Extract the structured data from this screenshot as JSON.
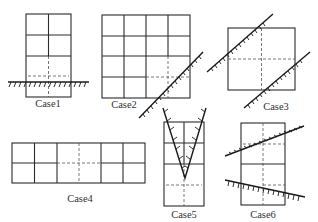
{
  "figure": {
    "cases": [
      {
        "id": "case1",
        "label": "Case1",
        "label_pos": [
          48,
          107
        ]
      },
      {
        "id": "case2",
        "label": "Case2",
        "label_pos": [
          124,
          108
        ]
      },
      {
        "id": "case3",
        "label": "Case3",
        "label_pos": [
          276,
          110
        ]
      },
      {
        "id": "case4",
        "label": "Case4",
        "label_pos": [
          80,
          202
        ]
      },
      {
        "id": "case5",
        "label": "Case5",
        "label_pos": [
          184,
          218
        ]
      },
      {
        "id": "case6",
        "label": "Case6",
        "label_pos": [
          263,
          218
        ]
      }
    ]
  }
}
